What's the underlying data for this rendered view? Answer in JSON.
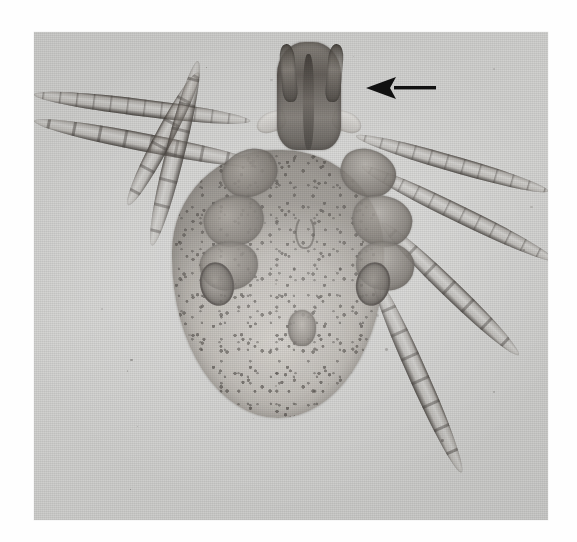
{
  "figure": {
    "domain": "micrograph",
    "caption": ""
  },
  "canvas": {
    "width_px": 577,
    "height_px": 542,
    "page_background": "#ffffff"
  },
  "photo_plate": {
    "name": "halftone-photograph",
    "left_px": 34,
    "top_px": 32,
    "width_px": 514,
    "height_px": 488,
    "background": "#d3d3d1",
    "border_visible": false,
    "render": "grayscale halftone, printed plate"
  },
  "annotation": {
    "arrow": {
      "name": "pointer-arrow",
      "color": "#111111",
      "direction": "left",
      "tip_x_px": 367,
      "tip_y_px": 88,
      "tail_x_px": 433,
      "tail_y_px": 88,
      "points_at": "capitulum"
    },
    "labels": []
  },
  "anatomy": {
    "capitulum": {
      "label": "capitulum",
      "center_x_px": 309,
      "center_y_px": 96
    },
    "palps": {
      "label": "palps",
      "count": 2
    },
    "hypostome": {
      "label": "hypostome"
    },
    "idiosoma": {
      "label": "idiosoma",
      "center_x_px": 278,
      "center_y_px": 284,
      "surface": "punctate"
    },
    "spiracular_plates": {
      "label": "spiracular plates",
      "count": 2
    },
    "genital_aperture": {
      "label": "genital aperture",
      "center_x_px": 302,
      "center_y_px": 328
    },
    "legs": {
      "label": "legs",
      "pairs": 4,
      "total": 8,
      "segmented": true
    }
  },
  "colors": {
    "plate_base": "#d3d3d1",
    "cuticle_dark": "#2e2a26",
    "cuticle_mid": "#8e8881",
    "cuticle_light": "#cfcbc5",
    "arrow": "#111111",
    "page": "#ffffff"
  },
  "legs_geometry": [
    {
      "name": "leg-left-I",
      "x": 34,
      "y": 86,
      "len": 218,
      "thick": 17,
      "rot": 7
    },
    {
      "name": "leg-left-II",
      "x": 34,
      "y": 112,
      "len": 232,
      "thick": 18,
      "rot": 11
    },
    {
      "name": "leg-left-III",
      "x": 128,
      "y": 196,
      "len": 150,
      "thick": 18,
      "rot": -62
    },
    {
      "name": "leg-left-IV",
      "x": 152,
      "y": 236,
      "len": 190,
      "thick": 19,
      "rot": -76
    },
    {
      "name": "leg-right-I",
      "x": 356,
      "y": 128,
      "len": 200,
      "thick": 16,
      "rot": 16
    },
    {
      "name": "leg-right-II",
      "x": 362,
      "y": 158,
      "len": 214,
      "thick": 17,
      "rot": 26
    },
    {
      "name": "leg-right-III",
      "x": 382,
      "y": 214,
      "len": 190,
      "thick": 18,
      "rot": 44
    },
    {
      "name": "leg-right-IV",
      "x": 372,
      "y": 262,
      "len": 220,
      "thick": 19,
      "rot": 66
    }
  ],
  "coxae_geometry": [
    {
      "name": "coxa-left-I",
      "x": 222,
      "y": 150,
      "w": 56,
      "h": 46,
      "rot": -22
    },
    {
      "name": "coxa-left-II",
      "x": 204,
      "y": 196,
      "w": 60,
      "h": 50,
      "rot": -14
    },
    {
      "name": "coxa-left-III",
      "x": 200,
      "y": 242,
      "w": 58,
      "h": 48,
      "rot": -8
    },
    {
      "name": "coxa-right-I",
      "x": 340,
      "y": 150,
      "w": 56,
      "h": 46,
      "rot": 22
    },
    {
      "name": "coxa-right-II",
      "x": 352,
      "y": 196,
      "w": 60,
      "h": 50,
      "rot": 14
    },
    {
      "name": "coxa-right-III",
      "x": 356,
      "y": 242,
      "w": 58,
      "h": 48,
      "rot": 8
    }
  ]
}
